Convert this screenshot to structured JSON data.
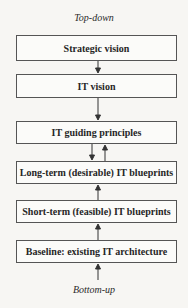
{
  "diagram": {
    "top_label": "Top-down",
    "bottom_label": "Bottom-up",
    "boxes": [
      {
        "label": "Strategic vision"
      },
      {
        "label": "IT vision"
      },
      {
        "label": "IT guiding principles"
      },
      {
        "label": "Long-term (desirable) IT blueprints"
      },
      {
        "label": "Short-term (feasible) IT blueprints"
      },
      {
        "label": "Baseline: existing IT architecture"
      }
    ],
    "colors": {
      "border": "#555555",
      "background": "#f7f6f3",
      "text": "#262626"
    }
  }
}
